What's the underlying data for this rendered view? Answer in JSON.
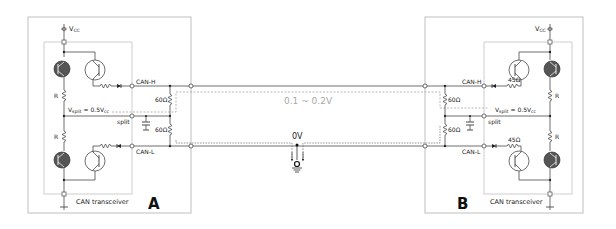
{
  "diagram": {
    "node_a": {
      "label": "A",
      "transceiver_label": "CAN transceiver",
      "vcc_label": "V",
      "vcc_sub": "CC",
      "vsplit_label": "V",
      "vsplit_sub": "split",
      "vsplit_value": " = 0.5V",
      "vsplit_value_sub": "cc",
      "resistor_upper": "R",
      "resistor_lower": "R",
      "pin_high": "CAN-H",
      "pin_split": "split",
      "pin_low": "CAN-L",
      "termination_upper": "60Ω",
      "termination_lower": "60Ω"
    },
    "node_b": {
      "label": "B",
      "transceiver_label": "CAN transceiver",
      "vcc_label": "V",
      "vcc_sub": "CC",
      "vsplit_label": "V",
      "vsplit_sub": "split",
      "vsplit_value": " = 0.5V",
      "vsplit_value_sub": "cc",
      "resistor_upper": "R",
      "resistor_lower": "R",
      "series_resistor_high": "45Ω",
      "series_resistor_low": "45Ω",
      "pin_high": "CAN-H",
      "pin_split": "split",
      "pin_low": "CAN-L",
      "termination_upper": "60Ω",
      "termination_lower": "60Ω"
    },
    "bus": {
      "differential_voltage": "0.1 ~ 0.2V",
      "ground_label": "0V"
    },
    "colors": {
      "wire": "#4a4a4a",
      "box": "#b0b0b0",
      "dashed": "#9a9a9a",
      "transistor_fill": "#555555",
      "voltage_text": "#a8a8a8"
    }
  }
}
